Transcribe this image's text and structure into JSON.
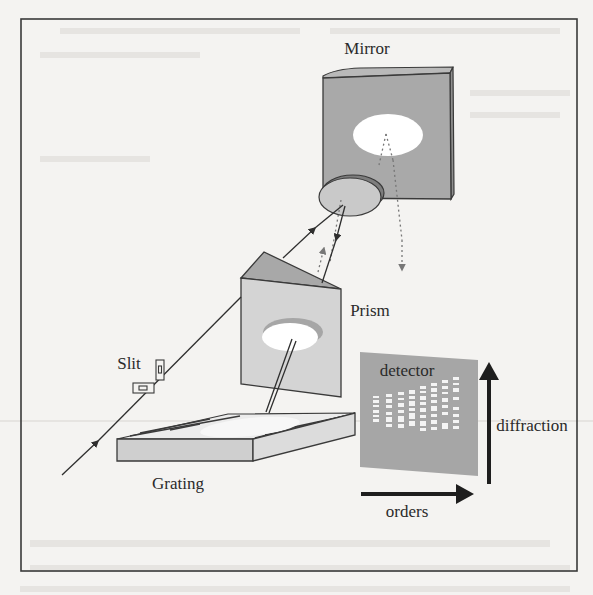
{
  "figure": {
    "labels": {
      "mirror": "Mirror",
      "prism": "Prism",
      "slit": "Slit",
      "grating": "Grating",
      "detector": "detector",
      "diffraction": "diffraction",
      "orders": "orders"
    },
    "components": [
      {
        "name": "Slit",
        "type": "entrance-slit"
      },
      {
        "name": "Grating",
        "type": "echelle-grating"
      },
      {
        "name": "Prism",
        "type": "cross-disperser"
      },
      {
        "name": "Mirror",
        "type": "focusing-mirror"
      },
      {
        "name": "detector",
        "type": "2D-array"
      }
    ],
    "axes": {
      "vertical_arrow": "diffraction",
      "horizontal_arrow": "orders"
    },
    "colors": {
      "frame": "#3a3a3a",
      "mirror_face": "#a9a9a9",
      "mirror_edge": "#8e8e8e",
      "prism_face": "#d4d4d4",
      "prism_top": "#a8a8a8",
      "grating_face": "#cfcfcf",
      "detector": "#a6a6a6",
      "line": "#2e2e2e",
      "background": "#f4f3f1"
    }
  }
}
